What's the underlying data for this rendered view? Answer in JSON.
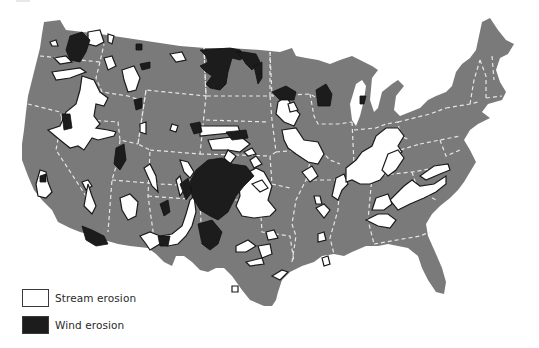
{
  "map": {
    "title": "",
    "subject": "Erosion areas of the conterminous United States",
    "colors": {
      "land": "#7a7a7a",
      "stream_erosion": "#ffffff",
      "wind_erosion": "#1c1c1c",
      "outline": "#1a1a1a",
      "state_borders": "#e6e6e6",
      "background": "#ffffff"
    }
  },
  "legend": {
    "items": [
      {
        "key": "stream",
        "label": "Stream erosion",
        "swatch": "white-box"
      },
      {
        "key": "wind",
        "label": "Wind erosion",
        "swatch": "black-box"
      }
    ]
  }
}
